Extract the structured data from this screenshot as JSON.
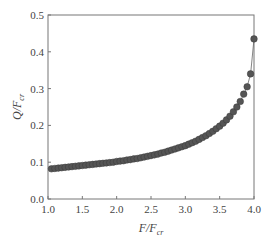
{
  "chart_data": {
    "type": "line",
    "title": "",
    "xlabel": "F/F_cr",
    "ylabel": "Q/F_cr",
    "xlabel_main": "F/F",
    "xlabel_sub": "cr",
    "ylabel_main": "Q/F",
    "ylabel_sub": "cr",
    "xlim": [
      1.0,
      4.0
    ],
    "ylim": [
      0.0,
      0.5
    ],
    "xticks": [
      "1.0",
      "1.5",
      "2.0",
      "2.5",
      "3.0",
      "3.5",
      "4.0"
    ],
    "yticks": [
      "0.0",
      "0.1",
      "0.2",
      "0.3",
      "0.4",
      "0.5"
    ],
    "grid": false,
    "legend": null,
    "marker": "filled-circle",
    "series_color": "#555555",
    "series": [
      {
        "name": "Q/F_cr",
        "x": [
          1.05,
          1.1,
          1.15,
          1.2,
          1.25,
          1.3,
          1.35,
          1.4,
          1.45,
          1.5,
          1.55,
          1.6,
          1.65,
          1.7,
          1.75,
          1.8,
          1.85,
          1.9,
          1.95,
          2.0,
          2.05,
          2.1,
          2.15,
          2.2,
          2.25,
          2.3,
          2.35,
          2.4,
          2.45,
          2.5,
          2.55,
          2.6,
          2.65,
          2.7,
          2.75,
          2.8,
          2.85,
          2.9,
          2.95,
          3.0,
          3.05,
          3.1,
          3.15,
          3.2,
          3.25,
          3.3,
          3.35,
          3.4,
          3.45,
          3.5,
          3.55,
          3.6,
          3.65,
          3.7,
          3.75,
          3.8,
          3.85,
          3.9,
          3.95,
          4.0
        ],
        "values": [
          0.082,
          0.083,
          0.084,
          0.085,
          0.086,
          0.087,
          0.088,
          0.089,
          0.09,
          0.091,
          0.092,
          0.093,
          0.094,
          0.095,
          0.096,
          0.097,
          0.098,
          0.099,
          0.1,
          0.102,
          0.103,
          0.104,
          0.106,
          0.107,
          0.109,
          0.11,
          0.112,
          0.114,
          0.116,
          0.118,
          0.12,
          0.122,
          0.125,
          0.127,
          0.13,
          0.133,
          0.136,
          0.139,
          0.142,
          0.145,
          0.149,
          0.153,
          0.157,
          0.162,
          0.167,
          0.172,
          0.178,
          0.184,
          0.191,
          0.198,
          0.206,
          0.215,
          0.225,
          0.237,
          0.25,
          0.265,
          0.285,
          0.305,
          0.34,
          0.435
        ]
      }
    ]
  }
}
